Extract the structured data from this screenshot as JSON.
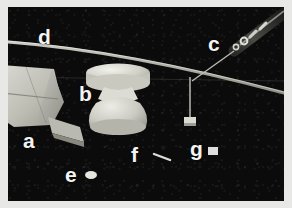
{
  "figure": {
    "kind": "labeled-photograph",
    "background_color": "#0c0c0c",
    "border_color": "#e8e8e6",
    "label_color": "#f4f4f2",
    "labels": [
      {
        "id": "a",
        "text": "a",
        "target": "wedge-plate-object"
      },
      {
        "id": "b",
        "text": "b",
        "target": "spool-shaped-object"
      },
      {
        "id": "c",
        "text": "c",
        "target": "needle-instrument"
      },
      {
        "id": "d",
        "text": "d",
        "target": "curved-rod"
      },
      {
        "id": "e",
        "text": "e",
        "target": "small-oval-marker"
      },
      {
        "id": "f",
        "text": "f",
        "target": "short-dash-marker"
      },
      {
        "id": "g",
        "text": "g",
        "target": "small-square-marker"
      }
    ]
  }
}
